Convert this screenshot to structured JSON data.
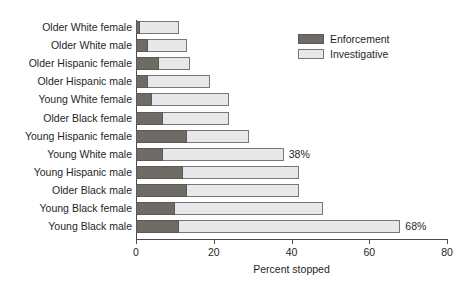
{
  "chart_data": {
    "type": "bar",
    "orientation": "horizontal",
    "stacked": true,
    "title": "",
    "xlabel": "Percent stopped",
    "ylabel": "",
    "xlim": [
      0,
      80
    ],
    "xticks": [
      0,
      20,
      40,
      60,
      80
    ],
    "grid": false,
    "legend_position": "top-right",
    "categories": [
      "Older White female",
      "Older White male",
      "Older Hispanic female",
      "Older Hispanic male",
      "Young White female",
      "Older Black female",
      "Young Hispanic female",
      "Young White male",
      "Young Hispanic male",
      "Older Black male",
      "Young Black female",
      "Young Black male"
    ],
    "series": [
      {
        "name": "Enforcement",
        "color": "#6e6a66",
        "values": [
          1,
          3,
          6,
          3,
          4,
          7,
          13,
          7,
          12,
          13,
          10,
          11
        ]
      },
      {
        "name": "Investigative",
        "color": "#e8e8ea",
        "values": [
          10,
          10,
          8,
          16,
          20,
          17,
          16,
          31,
          30,
          29,
          38,
          57
        ]
      }
    ],
    "totals": [
      11,
      13,
      14,
      19,
      24,
      24,
      29,
      38,
      42,
      42,
      48,
      68
    ],
    "annotations": [
      {
        "category": "Young White male",
        "text": "38%",
        "value": 38
      },
      {
        "category": "Young Black male",
        "text": "68%",
        "value": 68
      }
    ]
  },
  "legend": {
    "items": [
      {
        "label": "Enforcement",
        "swatch": "enforcement"
      },
      {
        "label": "Investigative",
        "swatch": "investigative"
      }
    ]
  }
}
